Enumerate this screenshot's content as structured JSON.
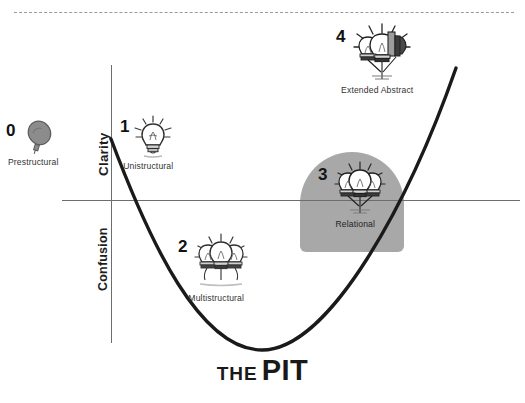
{
  "diagram": {
    "title_small": "THE",
    "title_large": "PIT",
    "axes": {
      "upper_label": "Clarity",
      "lower_label": "Confusion"
    },
    "divider": "dashed-rule",
    "highlight": {
      "name": "relational-highlight",
      "color": "#a8a8a8"
    },
    "curve": {
      "shape": "parabola",
      "color": "#1a1a1a",
      "start": [
        111,
        140
      ],
      "vertex": [
        262,
        350
      ],
      "end": [
        456,
        68
      ]
    },
    "stages": [
      {
        "number": "0",
        "label": "Prestructural",
        "icon": "unlit-bulb-icon",
        "bulbs": 1,
        "lit": false
      },
      {
        "number": "1",
        "label": "Unistructural",
        "icon": "lit-bulb-icon",
        "bulbs": 1,
        "lit": true
      },
      {
        "number": "2",
        "label": "Multistructural",
        "icon": "three-bulbs-icon",
        "bulbs": 3,
        "lit": true
      },
      {
        "number": "3",
        "label": "Relational",
        "icon": "connected-bulbs-icon",
        "bulbs": 3,
        "lit": true
      },
      {
        "number": "4",
        "label": "Extended Abstract",
        "icon": "abstract-bulbs-icon",
        "bulbs": 4,
        "lit": true
      }
    ]
  }
}
